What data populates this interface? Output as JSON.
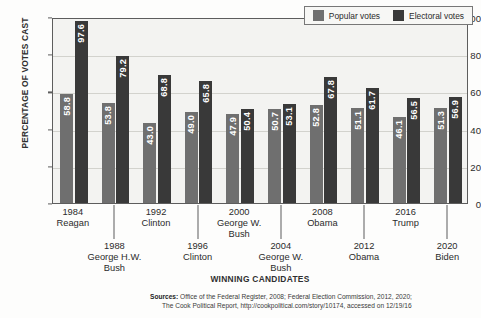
{
  "chart_data": {
    "type": "bar",
    "title": "",
    "xlabel": "WINNING CANDIDATES",
    "ylabel": "PERCENTAGE OF VOTES CAST",
    "ylim": [
      0,
      100
    ],
    "yticks": [
      0,
      20,
      40,
      60,
      80,
      100
    ],
    "grid": true,
    "legend_position": "top-right",
    "categories": [
      "1984 Reagan",
      "1988 George H.W. Bush",
      "1992 Clinton",
      "1996 Clinton",
      "2000 George W. Bush",
      "2004 George W. Bush",
      "2008 Obama",
      "2012 Obama",
      "2016 Trump",
      "2020 Biden"
    ],
    "series": [
      {
        "name": "Popular votes",
        "color": "#6f6f6f",
        "values": [
          58.8,
          53.8,
          43.0,
          49.0,
          47.9,
          50.7,
          52.8,
          51.1,
          46.1,
          51.3
        ]
      },
      {
        "name": "Electoral votes",
        "color": "#393939",
        "values": [
          97.6,
          79.2,
          68.8,
          65.8,
          50.4,
          53.1,
          67.8,
          61.7,
          56.5,
          56.9
        ]
      }
    ]
  },
  "axes": {
    "y_title": "PERCENTAGE OF VOTES CAST",
    "x_title": "WINNING CANDIDATES",
    "y_ticks": [
      "100",
      "80",
      "60",
      "40",
      "20",
      "0"
    ]
  },
  "legend": {
    "items": [
      {
        "label": "Popular votes",
        "color": "#6f6f6f"
      },
      {
        "label": "Electoral votes",
        "color": "#393939"
      }
    ]
  },
  "x_labels": [
    {
      "year": "1984",
      "name": "Reagan",
      "name2": ""
    },
    {
      "year": "1988",
      "name": "George H.W.",
      "name2": "Bush"
    },
    {
      "year": "1992",
      "name": "Clinton",
      "name2": ""
    },
    {
      "year": "1996",
      "name": "Clinton",
      "name2": ""
    },
    {
      "year": "2000",
      "name": "George W.",
      "name2": "Bush"
    },
    {
      "year": "2004",
      "name": "George W.",
      "name2": "Bush"
    },
    {
      "year": "2008",
      "name": "Obama",
      "name2": ""
    },
    {
      "year": "2012",
      "name": "Obama",
      "name2": ""
    },
    {
      "year": "2016",
      "name": "Trump",
      "name2": ""
    },
    {
      "year": "2020",
      "name": "Biden",
      "name2": ""
    }
  ],
  "sources": {
    "label": "Sources:",
    "line1": " Office of the Federal Register, 2008; Federal Election Commission, 2012, 2020;",
    "line2": "The Cook Political Report, http://cookpolitical.com/story/10174, accessed on 12/19/16"
  }
}
